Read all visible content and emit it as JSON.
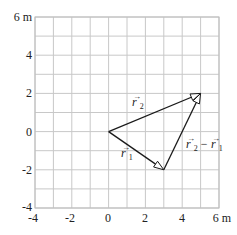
{
  "diagram": {
    "title": "",
    "axes": {
      "x": {
        "min": -4,
        "max": 6,
        "ticks": [
          "-4",
          "-2",
          "0",
          "2",
          "4",
          "6 m"
        ],
        "grid_step": 1
      },
      "y": {
        "min": -4,
        "max": 6,
        "ticks": [
          "-4",
          "-2",
          "0",
          "2",
          "4",
          "6 m"
        ],
        "grid_step": 1
      }
    },
    "vectors": [
      {
        "name": "r1",
        "label": "r",
        "subscript": "1",
        "from": [
          0,
          0
        ],
        "to": [
          3,
          -2
        ]
      },
      {
        "name": "r2",
        "label": "r",
        "subscript": "2",
        "from": [
          0,
          0
        ],
        "to": [
          5,
          2
        ]
      },
      {
        "name": "r2-minus-r1",
        "label_a": "r",
        "sub_a": "2",
        "op": " − ",
        "label_b": "r",
        "sub_b": "1",
        "from": [
          3,
          -2
        ],
        "to": [
          5,
          2
        ]
      }
    ],
    "colors": {
      "grid": "#c8c8c8",
      "vector": "#1a1a1a",
      "background": "#ffffff"
    }
  }
}
